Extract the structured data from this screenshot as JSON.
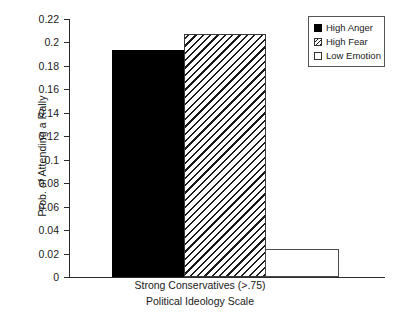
{
  "chart_data": {
    "type": "bar",
    "title": "",
    "subtitle": "",
    "xlabel": "Political Ideology Scale",
    "ylabel": "Prob. of Attending a Rally",
    "categories": [
      "Strong Conservatives (>.75)"
    ],
    "series": [
      {
        "name": "High Anger",
        "values": [
          0.194
        ],
        "fill": "solid-black"
      },
      {
        "name": "High Fear",
        "values": [
          0.207
        ],
        "fill": "diagonal-hatch"
      },
      {
        "name": "Low Emotion",
        "values": [
          0.024
        ],
        "fill": "open-white"
      }
    ],
    "ylim": [
      0,
      0.22
    ],
    "yticks": [
      0,
      0.02,
      0.04,
      0.06,
      0.08,
      0.1,
      0.12,
      0.14,
      0.16,
      0.18,
      0.2,
      0.22
    ],
    "ytick_labels": [
      "0",
      "0.02",
      "0.04",
      "0.06",
      "0.08",
      "0.1",
      "0.12",
      "0.14",
      "0.16",
      "0.18",
      "0.2",
      "0.22"
    ],
    "grid": false,
    "legend_position": "top-right",
    "colors": {
      "axis": "#2b2b2b",
      "text": "#1a1a1a",
      "bar_solid": "#000000",
      "bar_hatch_line": "#1a1a1a",
      "bar_open_border": "#4a4a4a",
      "background": "#ffffff",
      "legend_border": "#555555"
    }
  },
  "legend": {
    "items": [
      {
        "label": "High Anger"
      },
      {
        "label": "High Fear"
      },
      {
        "label": "Low Emotion"
      }
    ]
  },
  "axes": {
    "y_title": "Prob. of Attending a Rally",
    "x_tick_label": "Strong Conservatives (>.75)",
    "x_title": "Political Ideology Scale"
  }
}
